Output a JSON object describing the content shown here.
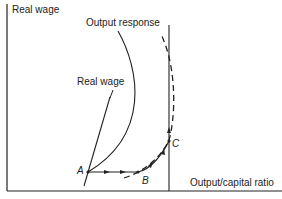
{
  "diagram": {
    "y_axis_label": "Real wage",
    "x_axis_label": "Output/capital ratio",
    "curves": {
      "output_response": "Output response",
      "real_wage": "Real wage"
    },
    "points": {
      "a": "A",
      "b": "B",
      "c": "C"
    },
    "colors": {
      "line": "#222222",
      "background": "#ffffff"
    }
  }
}
